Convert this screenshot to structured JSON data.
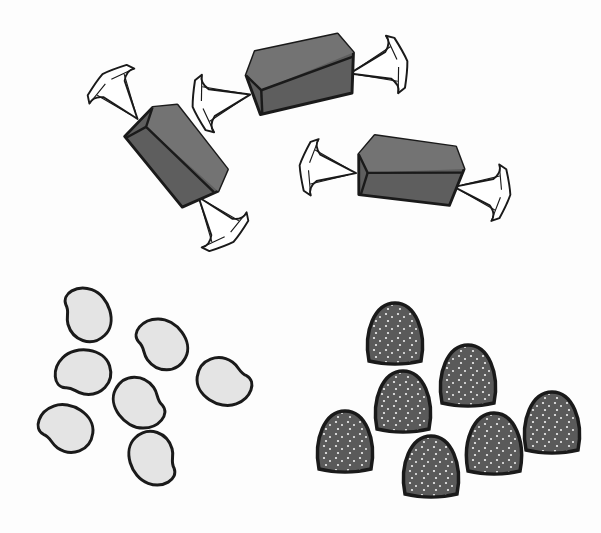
{
  "scene": {
    "title": "Assorted candies illustration",
    "style": "grayscale ink drawing",
    "groups": [
      {
        "name": "wrapped-caramels",
        "count": 3,
        "description": "square caramels in twisted wrappers"
      },
      {
        "name": "jelly-beans",
        "count": 7,
        "description": "light gray bean-shaped candies with dark outlines"
      },
      {
        "name": "gumdrops",
        "count": 7,
        "description": "dark sugar-coated gumdrops with white speckles"
      }
    ]
  },
  "colors": {
    "background": "#fdfdfd",
    "outline": "#1a1a1a",
    "caramel_top": "#6f6f6f",
    "caramel_side": "#5e5e5e",
    "wrapper": "#ffffff",
    "jellybean": "#e4e4e4",
    "gumdrop": "#5a5a5a",
    "sugar": "#f2f2f2"
  }
}
